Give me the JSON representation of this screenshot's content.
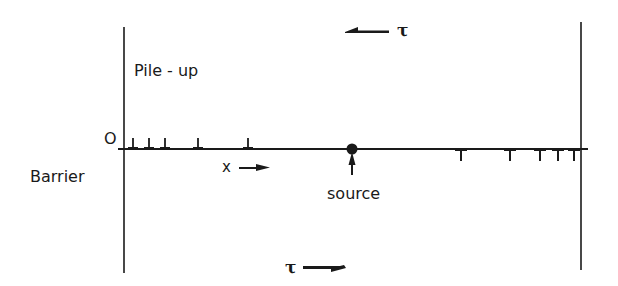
{
  "diagram": {
    "labels": {
      "pile_up": "Pile - up",
      "origin": "O",
      "barrier": "Barrier",
      "x_axis": "x",
      "source": "source",
      "tau_top": "τ",
      "tau_bottom": "τ"
    },
    "arrows": {
      "top": {
        "direction": "left",
        "label": "τ"
      },
      "bottom": {
        "direction": "right",
        "label": "τ"
      },
      "x_axis": {
        "direction": "right",
        "label": "x"
      },
      "source_pointer": {
        "direction": "up",
        "label": "source"
      }
    },
    "slip_plane": {
      "y": 149,
      "x_start": 118,
      "x_end": 588
    },
    "barriers": [
      {
        "name": "left-barrier",
        "x": 124,
        "y_top": 27,
        "y_bottom": 273
      },
      {
        "name": "right-barrier",
        "x": 581,
        "y_top": 22,
        "y_bottom": 270
      }
    ],
    "source_position": {
      "x": 352,
      "y": 149
    },
    "dislocations_left": [
      133,
      149,
      165,
      198,
      248
    ],
    "dislocations_right": [
      461,
      510,
      540,
      558,
      574
    ],
    "colors": {
      "ink": "#1a1a1a",
      "background": "#ffffff"
    }
  }
}
